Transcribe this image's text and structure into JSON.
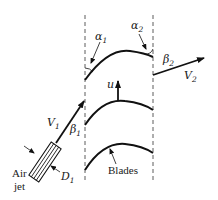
{
  "diagram": {
    "labels": {
      "alpha1": {
        "sym": "α",
        "sub": "1"
      },
      "alpha2": {
        "sym": "α",
        "sub": "2"
      },
      "beta1": {
        "sym": "β",
        "sub": "1"
      },
      "beta2": {
        "sym": "β",
        "sub": "2"
      },
      "V1": {
        "sym": "V",
        "sub": "1"
      },
      "V2": {
        "sym": "V",
        "sub": "2"
      },
      "D1": {
        "sym": "D",
        "sub": "1"
      },
      "u": "u",
      "air_jet_line1": "Air",
      "air_jet_line2": "jet",
      "blades": "Blades"
    },
    "colors": {
      "ink": "#111111",
      "background": "#ffffff"
    }
  }
}
